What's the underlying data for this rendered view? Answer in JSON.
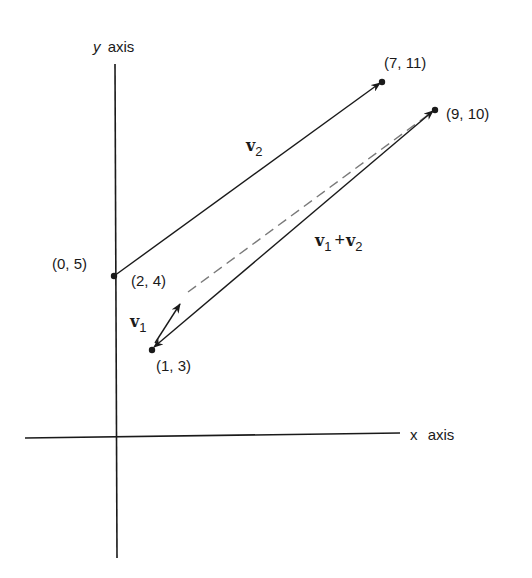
{
  "diagram": {
    "axes": {
      "y_label_var": "y",
      "y_label_word": "axis",
      "x_label_var": "x",
      "x_label_word": "axis"
    },
    "points": [
      {
        "id": "p05",
        "label": "(0, 5)"
      },
      {
        "id": "p24",
        "label": "(2, 4)"
      },
      {
        "id": "p13",
        "label": "(1, 3)"
      },
      {
        "id": "p711",
        "label": "(7, 11)"
      },
      {
        "id": "p910",
        "label": "(9, 10)"
      }
    ],
    "vectors": {
      "v1": {
        "base": "v",
        "sub": "1",
        "from": "(1, 3)",
        "to": "(2, 4)"
      },
      "v2": {
        "base": "v",
        "sub": "2",
        "from": "(0, 5)",
        "to": "(7, 11)"
      },
      "sum": {
        "base1": "v",
        "sub1": "1",
        "plus": "+",
        "base2": "v",
        "sub2": "2",
        "from": "(1, 3)",
        "to": "(9, 10)"
      }
    },
    "colors": {
      "ink": "#1a1a1a",
      "dashed": "#7a7a7a"
    }
  }
}
